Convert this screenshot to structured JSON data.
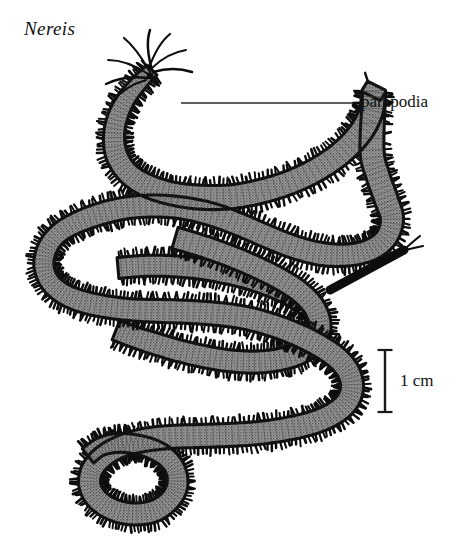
{
  "figure": {
    "background_color": "#ffffff",
    "width": 466,
    "height": 555
  },
  "taxon": {
    "name": "Nereis",
    "style": "italic"
  },
  "annotations": {
    "parapodia_label": "parapodia",
    "leader_line": {
      "x1": 181,
      "y1": 103,
      "x2": 352,
      "y2": 103,
      "color": "#2a2a2a"
    }
  },
  "scale_bar": {
    "label": "1 cm",
    "orientation": "vertical",
    "x": 385,
    "y_top": 350,
    "y_bottom": 412,
    "cap_width": 15,
    "color": "#1a1a1a"
  },
  "organism": {
    "common_name": "ragworm",
    "body_fill_color": "#8d8d8d",
    "outline_color": "#111111",
    "parapodia_color": "#0d0d0d",
    "head_appendage_count": 8,
    "tail_cirri_count": 2,
    "body_path": "M 150 78 C 128 96 112 124 112 150 C 112 182 136 204 176 212 C 232 224 296 214 342 188 C 384 164 400 132 382 112",
    "description": "Dorsal view of a coiled polychaete worm with paired lateral parapodia along the entire body"
  },
  "chart_data": {
    "type": "scatter",
    "title": "Nereis",
    "annotations": [
      "parapodia",
      "1 cm"
    ],
    "scale_bar_cm": 1,
    "scale_bar_pixels": 62
  }
}
